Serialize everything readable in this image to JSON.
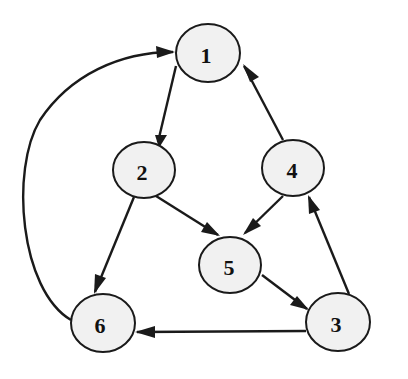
{
  "diagram": {
    "type": "directed-graph",
    "colors": {
      "node_fill": "#f1f1f1",
      "stroke": "#1a1a1a",
      "label": "#111111",
      "background": "#ffffff"
    },
    "nodes": [
      {
        "id": "1",
        "label": "1",
        "cx": 208,
        "cy": 53,
        "rx": 32,
        "ry": 29
      },
      {
        "id": "2",
        "label": "2",
        "cx": 144,
        "cy": 170,
        "rx": 31,
        "ry": 28
      },
      {
        "id": "3",
        "label": "3",
        "cx": 338,
        "cy": 322,
        "rx": 32,
        "ry": 29
      },
      {
        "id": "4",
        "label": "4",
        "cx": 293,
        "cy": 168,
        "rx": 31,
        "ry": 28
      },
      {
        "id": "5",
        "label": "5",
        "cx": 230,
        "cy": 265,
        "rx": 31,
        "ry": 28
      },
      {
        "id": "6",
        "label": "6",
        "cx": 103,
        "cy": 323,
        "rx": 32,
        "ry": 29
      }
    ],
    "edges": [
      {
        "from": "1",
        "to": "2"
      },
      {
        "from": "4",
        "to": "1"
      },
      {
        "from": "2",
        "to": "5"
      },
      {
        "from": "4",
        "to": "5"
      },
      {
        "from": "2",
        "to": "6"
      },
      {
        "from": "5",
        "to": "3"
      },
      {
        "from": "3",
        "to": "4"
      },
      {
        "from": "3",
        "to": "6"
      },
      {
        "from": "6",
        "to": "1",
        "curved": true
      }
    ]
  }
}
